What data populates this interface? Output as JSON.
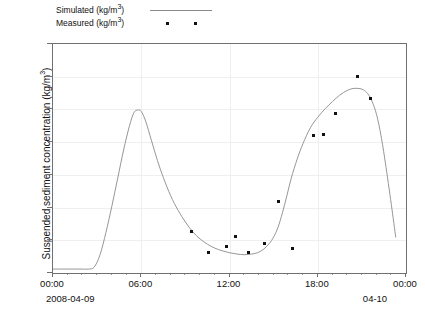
{
  "legend": {
    "position": "top-left",
    "entries": [
      {
        "label": "Simulated (kg/m",
        "sup": "3",
        "label_tail": ")",
        "full": "Simulated (kg/m3)",
        "type": "line",
        "color": "#8a8a8a"
      },
      {
        "label": "Measured (kg/m",
        "sup": "3",
        "label_tail": ")",
        "full": "Measured (kg/m3)",
        "type": "markers",
        "color": "#111111"
      }
    ]
  },
  "axes": {
    "ylabel_main": "Suspended sediment concentration (kg/m",
    "ylabel_sup": "3",
    "ylabel_tail": ")",
    "ylabel_full": "Suspended sediment concentration (kg/m3)",
    "yticks": [
      "0.0",
      "0.5",
      "1.0",
      "1.5",
      "2.0",
      "2.5",
      "3.0",
      "3.5"
    ],
    "xticks": [
      "00:00",
      "06:00",
      "12:00",
      "18:00",
      "00:00"
    ],
    "date_left": "2008-04-09",
    "date_right": "04-10"
  },
  "chart_data": {
    "type": "line",
    "title": "",
    "xlabel": "",
    "ylabel": "Suspended sediment concentration (kg/m3)",
    "xlim": [
      0,
      24
    ],
    "ylim": [
      0.0,
      3.5
    ],
    "x_unit": "hours from 2008-04-09 00:00",
    "xtick_values": [
      0,
      6,
      12,
      18,
      24
    ],
    "xtick_labels": [
      "00:00",
      "06:00",
      "12:00",
      "18:00",
      "00:00"
    ],
    "ytick_values": [
      0.0,
      0.5,
      1.0,
      1.5,
      2.0,
      2.5,
      3.0,
      3.5
    ],
    "grid": true,
    "legend_position": "top-left",
    "series": [
      {
        "name": "Simulated (kg/m3)",
        "type": "line",
        "color": "#8a8a8a",
        "x": [
          0.0,
          0.5,
          1.0,
          1.5,
          2.0,
          2.4,
          2.8,
          3.2,
          3.6,
          4.0,
          4.4,
          4.8,
          5.2,
          5.5,
          5.75,
          6.0,
          6.3,
          6.7,
          7.1,
          7.5,
          8.0,
          8.5,
          9.0,
          9.5,
          10.0,
          10.5,
          11.0,
          11.5,
          12.0,
          12.5,
          13.0,
          13.5,
          13.9,
          14.3,
          14.7,
          15.0,
          15.3,
          15.6,
          15.9,
          16.2,
          16.6,
          17.0,
          17.5,
          18.0,
          18.5,
          19.0,
          19.5,
          20.0,
          20.4,
          20.8,
          21.1,
          21.4,
          21.7,
          22.0,
          22.3,
          22.6,
          23.0,
          23.3
        ],
        "y": [
          0.06,
          0.06,
          0.06,
          0.06,
          0.06,
          0.06,
          0.09,
          0.28,
          0.62,
          1.02,
          1.45,
          1.88,
          2.25,
          2.45,
          2.49,
          2.47,
          2.32,
          2.02,
          1.72,
          1.46,
          1.18,
          0.96,
          0.78,
          0.63,
          0.52,
          0.44,
          0.38,
          0.34,
          0.31,
          0.29,
          0.28,
          0.29,
          0.31,
          0.36,
          0.45,
          0.55,
          0.7,
          0.92,
          1.18,
          1.45,
          1.74,
          1.98,
          2.22,
          2.38,
          2.51,
          2.62,
          2.72,
          2.79,
          2.82,
          2.82,
          2.8,
          2.74,
          2.62,
          2.42,
          2.1,
          1.68,
          1.05,
          0.55
        ]
      },
      {
        "name": "Measured (kg/m3)",
        "type": "scatter",
        "color": "#111111",
        "points": [
          {
            "x": 9.4,
            "y": 0.63
          },
          {
            "x": 10.6,
            "y": 0.32
          },
          {
            "x": 11.8,
            "y": 0.41
          },
          {
            "x": 12.4,
            "y": 0.56
          },
          {
            "x": 13.3,
            "y": 0.31
          },
          {
            "x": 14.4,
            "y": 0.45
          },
          {
            "x": 15.3,
            "y": 1.09
          },
          {
            "x": 16.3,
            "y": 0.38
          },
          {
            "x": 17.7,
            "y": 2.1
          },
          {
            "x": 18.4,
            "y": 2.11
          },
          {
            "x": 19.2,
            "y": 2.44
          },
          {
            "x": 20.7,
            "y": 3.0
          },
          {
            "x": 21.6,
            "y": 2.67
          }
        ]
      }
    ]
  }
}
